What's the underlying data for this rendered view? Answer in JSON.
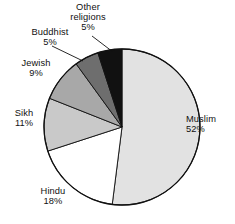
{
  "chart_data": {
    "type": "pie",
    "title": "",
    "subtitle": "",
    "xlabel": "",
    "ylabel": "",
    "legend_position": "none",
    "grid": false,
    "labels_inline": true,
    "start_angle_deg": 0,
    "direction": "clockwise",
    "categories": [
      "Muslim",
      "Hindu",
      "Sikh",
      "Jewish",
      "Buddhist",
      "Other religions"
    ],
    "values": [
      52,
      18,
      11,
      9,
      5,
      5
    ],
    "value_unit": "%",
    "slices": [
      {
        "name": "Muslim",
        "value": 52,
        "label": "Muslim",
        "value_label": "52%",
        "color": "#e2e2e2"
      },
      {
        "name": "Hindu",
        "value": 18,
        "label": "Hindu",
        "value_label": "18%",
        "color": "#ffffff"
      },
      {
        "name": "Sikh",
        "value": 11,
        "label": "Sikh",
        "value_label": "11%",
        "color": "#c9c9c9"
      },
      {
        "name": "Jewish",
        "value": 9,
        "label": "Jewish",
        "value_label": "9%",
        "color": "#a8a8a8"
      },
      {
        "name": "Buddhist",
        "value": 5,
        "label": "Buddhist",
        "value_label": "5%",
        "color": "#6e6e6e"
      },
      {
        "name": "Other religions",
        "value": 5,
        "label": "Other religions",
        "value_label": "5%",
        "color": "#111111"
      }
    ]
  },
  "labels": {
    "other": {
      "line1": "Other",
      "line2": "religions",
      "line3": "5%"
    },
    "buddhist": {
      "line1": "Buddhist",
      "line2": "5%"
    },
    "jewish": {
      "line1": "Jewish",
      "line2": "9%"
    },
    "sikh": {
      "line1": "Sikh",
      "line2": "11%"
    },
    "hindu": {
      "line1": "Hindu",
      "line2": "18%"
    },
    "muslim": {
      "line1": "Muslim",
      "line2": "52%"
    }
  },
  "style": {
    "outline_color": "#111111",
    "background": "#ffffff",
    "leader_line_color": "#111111"
  }
}
